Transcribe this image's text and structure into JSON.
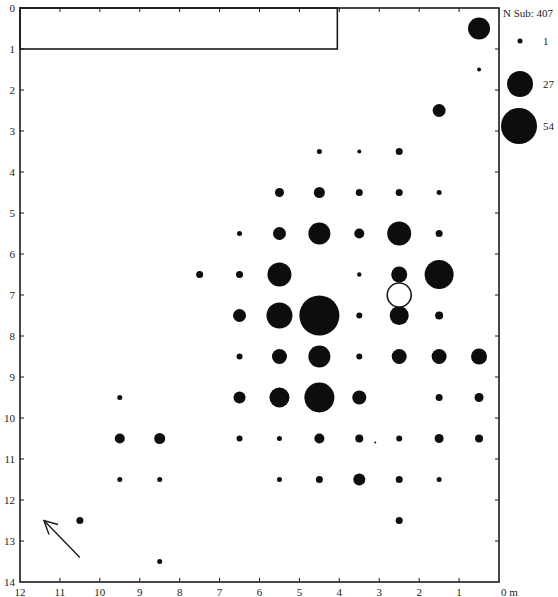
{
  "chart_data": {
    "type": "scatter",
    "subtype": "proportional-symbol grid plan",
    "title": "",
    "xlabel": "m",
    "ylabel": "",
    "x_axis": {
      "direction": "reversed",
      "range": [
        12,
        0
      ],
      "ticks": [
        12,
        11,
        10,
        9,
        8,
        7,
        6,
        5,
        4,
        3,
        2,
        1,
        0
      ],
      "unit_label": "0 m"
    },
    "y_axis": {
      "direction": "top-down",
      "range": [
        0,
        14
      ],
      "ticks": [
        0,
        1,
        2,
        3,
        4,
        5,
        6,
        7,
        8,
        9,
        10,
        11,
        12,
        13,
        14
      ]
    },
    "legend": {
      "title": "N Sub: 407",
      "entries": [
        {
          "label": "1",
          "r": 2.5
        },
        {
          "label": "27",
          "r": 13
        },
        {
          "label": "54",
          "r": 18
        }
      ]
    },
    "rectangle": {
      "x0": 12,
      "x1": 4.05,
      "y0": 0,
      "y1": 1,
      "note": "outlined area top-left"
    },
    "open_circle": {
      "x": 2.5,
      "y": 7.0,
      "r": 12
    },
    "north_arrow": {
      "from": [
        10.5,
        13.4
      ],
      "to": [
        11.4,
        12.5
      ]
    },
    "points": [
      {
        "x": 0.5,
        "y": 0.5,
        "r": 11
      },
      {
        "x": 0.5,
        "y": 1.5,
        "r": 2
      },
      {
        "x": 1.5,
        "y": 2.5,
        "r": 6.5
      },
      {
        "x": 4.5,
        "y": 3.5,
        "r": 2.5
      },
      {
        "x": 3.5,
        "y": 3.5,
        "r": 2
      },
      {
        "x": 2.5,
        "y": 3.5,
        "r": 3.5
      },
      {
        "x": 5.5,
        "y": 4.5,
        "r": 4.5
      },
      {
        "x": 4.5,
        "y": 4.5,
        "r": 5.5
      },
      {
        "x": 3.5,
        "y": 4.5,
        "r": 3.5
      },
      {
        "x": 2.5,
        "y": 4.5,
        "r": 3.5
      },
      {
        "x": 1.5,
        "y": 4.5,
        "r": 2.5
      },
      {
        "x": 6.5,
        "y": 5.5,
        "r": 2.5
      },
      {
        "x": 5.5,
        "y": 5.5,
        "r": 6.5
      },
      {
        "x": 4.5,
        "y": 5.5,
        "r": 11
      },
      {
        "x": 3.5,
        "y": 5.5,
        "r": 5
      },
      {
        "x": 2.5,
        "y": 5.5,
        "r": 12
      },
      {
        "x": 1.5,
        "y": 5.5,
        "r": 3.5
      },
      {
        "x": 7.5,
        "y": 6.5,
        "r": 3.5
      },
      {
        "x": 6.5,
        "y": 6.5,
        "r": 3.5
      },
      {
        "x": 5.5,
        "y": 6.5,
        "r": 12
      },
      {
        "x": 3.5,
        "y": 6.5,
        "r": 2.2
      },
      {
        "x": 2.5,
        "y": 6.5,
        "r": 8
      },
      {
        "x": 1.5,
        "y": 6.5,
        "r": 14.5
      },
      {
        "x": 6.5,
        "y": 7.5,
        "r": 6.5
      },
      {
        "x": 5.5,
        "y": 7.5,
        "r": 13
      },
      {
        "x": 4.5,
        "y": 7.5,
        "r": 20
      },
      {
        "x": 3.5,
        "y": 7.5,
        "r": 3
      },
      {
        "x": 2.5,
        "y": 7.5,
        "r": 9.5
      },
      {
        "x": 1.5,
        "y": 7.5,
        "r": 4
      },
      {
        "x": 6.5,
        "y": 8.5,
        "r": 3
      },
      {
        "x": 5.5,
        "y": 8.5,
        "r": 7.5
      },
      {
        "x": 4.5,
        "y": 8.5,
        "r": 11
      },
      {
        "x": 3.5,
        "y": 8.5,
        "r": 3
      },
      {
        "x": 2.5,
        "y": 8.5,
        "r": 7.5
      },
      {
        "x": 1.5,
        "y": 8.5,
        "r": 7.5
      },
      {
        "x": 0.5,
        "y": 8.5,
        "r": 8
      },
      {
        "x": 9.5,
        "y": 9.5,
        "r": 2.5
      },
      {
        "x": 6.5,
        "y": 9.5,
        "r": 6
      },
      {
        "x": 5.5,
        "y": 9.5,
        "r": 10
      },
      {
        "x": 4.5,
        "y": 9.5,
        "r": 15
      },
      {
        "x": 3.5,
        "y": 9.5,
        "r": 7
      },
      {
        "x": 1.5,
        "y": 9.5,
        "r": 3.5
      },
      {
        "x": 0.5,
        "y": 9.5,
        "r": 4.5
      },
      {
        "x": 9.5,
        "y": 10.5,
        "r": 5
      },
      {
        "x": 8.5,
        "y": 10.5,
        "r": 5.5
      },
      {
        "x": 6.5,
        "y": 10.5,
        "r": 3
      },
      {
        "x": 5.5,
        "y": 10.5,
        "r": 2.5
      },
      {
        "x": 4.5,
        "y": 10.5,
        "r": 5
      },
      {
        "x": 3.5,
        "y": 10.5,
        "r": 4
      },
      {
        "x": 3.1,
        "y": 10.6,
        "r": 1
      },
      {
        "x": 2.5,
        "y": 10.5,
        "r": 3
      },
      {
        "x": 1.5,
        "y": 10.5,
        "r": 4.5
      },
      {
        "x": 0.5,
        "y": 10.5,
        "r": 4
      },
      {
        "x": 9.5,
        "y": 11.5,
        "r": 2.5
      },
      {
        "x": 8.5,
        "y": 11.5,
        "r": 2.5
      },
      {
        "x": 5.5,
        "y": 11.5,
        "r": 2.5
      },
      {
        "x": 4.5,
        "y": 11.5,
        "r": 3.5
      },
      {
        "x": 3.5,
        "y": 11.5,
        "r": 6
      },
      {
        "x": 2.5,
        "y": 11.5,
        "r": 3.5
      },
      {
        "x": 1.5,
        "y": 11.5,
        "r": 2.5
      },
      {
        "x": 10.5,
        "y": 12.5,
        "r": 3.5
      },
      {
        "x": 2.5,
        "y": 12.5,
        "r": 3.5
      },
      {
        "x": 8.5,
        "y": 13.5,
        "r": 2.5
      }
    ]
  }
}
